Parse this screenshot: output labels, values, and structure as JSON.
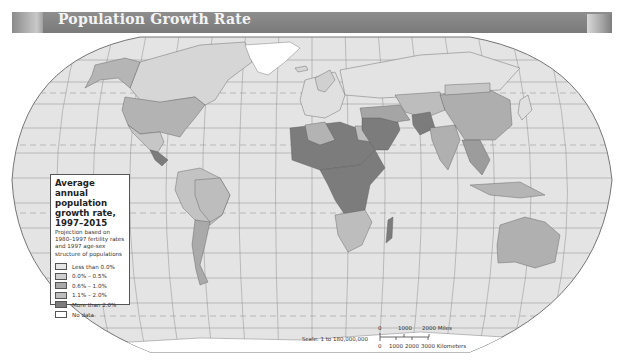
{
  "header": {
    "title": "Population Growth Rate"
  },
  "legend": {
    "title": "Average annual population growth rate, 1997–2015",
    "note": "Projection based on 1980–1997 fertility rates and 1997 age-sex structure of populations",
    "items": [
      {
        "label": "Less than 0.0%",
        "color": "#e6e6e6"
      },
      {
        "label": "0.0% – 0.5%",
        "color": "#cfcfcf"
      },
      {
        "label": "0.6% – 1.0%",
        "color": "#a9a9a9"
      },
      {
        "label": "1.1% – 2.0%",
        "color": "#bdbdbd"
      },
      {
        "label": "More than 2.0%",
        "color": "#7c7c7c"
      },
      {
        "label": "No data",
        "color": "#ffffff"
      }
    ]
  },
  "scale": {
    "label": "Scale: 1 to 180,000,000",
    "miles_ticks": [
      "0",
      "1000",
      "2000 Miles"
    ],
    "km_ticks": [
      "0",
      "1000",
      "2000",
      "3000 Kilometers"
    ]
  },
  "colors": {
    "ocean": "#e4e4e4",
    "graticule": "#8f8f8f",
    "header": "#858585"
  }
}
